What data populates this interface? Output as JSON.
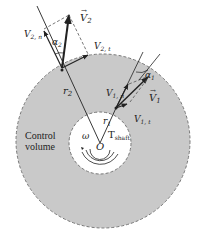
{
  "diagram": {
    "colors": {
      "control_volume": "#c9c9c9",
      "boundary": "#777777",
      "line": "#222222",
      "background": "#ffffff"
    },
    "labels": {
      "V2_vec": "V",
      "V2_vec_sub": "2",
      "V2n": "V",
      "V2n_sub": "2, n",
      "V2t": "V",
      "V2t_sub": "2, t",
      "alpha2": "α",
      "alpha2_sub": "2",
      "r2": "r",
      "r2_sub": "2",
      "V1n": "V",
      "V1n_sub": "1, n",
      "V1_vec": "V",
      "V1_vec_sub": "1",
      "V1t": "V",
      "V1t_sub": "1, t",
      "alpha1": "α",
      "alpha1_sub": "1",
      "r1": "r",
      "r1_sub": "1",
      "omega": "ω",
      "origin": "O",
      "torque": "T",
      "torque_sub": "shaft",
      "control_volume_line1": "Control",
      "control_volume_line2": "volume"
    }
  }
}
